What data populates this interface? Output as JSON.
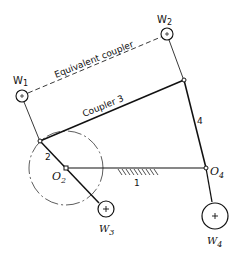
{
  "diagram": {
    "labels": {
      "equivalent_coupler": "Equivalent coupler",
      "coupler": "Coupler 3",
      "link2": "2",
      "link1": "1",
      "link4": "4",
      "o2_main": "O",
      "o2_sub": "2",
      "o4_main": "O",
      "o4_sub": "4",
      "w1_main": "W",
      "w1_sub": "1",
      "w2_main": "W",
      "w2_sub": "2",
      "w3_main": "W",
      "w3_sub": "3",
      "w4_main": "W",
      "w4_sub": "4"
    },
    "masses": [
      {
        "id": "W1",
        "symbol": "plus"
      },
      {
        "id": "W2",
        "symbol": "plus"
      },
      {
        "id": "W3",
        "symbol": "plus"
      },
      {
        "id": "W4",
        "symbol": "plus"
      }
    ],
    "links": [
      {
        "id": "1",
        "name": "ground link"
      },
      {
        "id": "2",
        "name": "crank"
      },
      {
        "id": "3",
        "name": "coupler"
      },
      {
        "id": "4",
        "name": "rocker"
      }
    ],
    "colors": {
      "ink": "#111111",
      "paper": "#ffffff"
    }
  }
}
